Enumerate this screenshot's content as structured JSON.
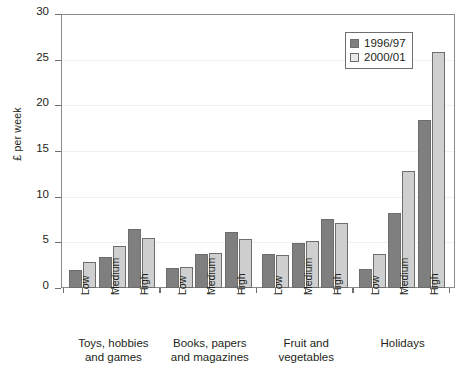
{
  "chart_data": {
    "type": "bar",
    "title": "",
    "xlabel": "",
    "ylabel": "£ per week",
    "ylim": [
      0,
      30
    ],
    "yticks": [
      0,
      5,
      10,
      15,
      20,
      25,
      30
    ],
    "grid": true,
    "legend_position": "top-right",
    "categories": [
      "Low",
      "Medium",
      "High"
    ],
    "groups": [
      {
        "label_line1": "Toys, hobbies",
        "label_line2": "and games",
        "label": "Toys, hobbies and games",
        "categories": [
          "Low",
          "Medium",
          "High"
        ],
        "series": [
          {
            "name": "1996/97",
            "values": [
              2.0,
              3.4,
              6.5
            ]
          },
          {
            "name": "2000/01",
            "values": [
              2.9,
              4.6,
              5.5
            ]
          }
        ]
      },
      {
        "label_line1": "Books, papers",
        "label_line2": "and magazines",
        "label": "Books, papers and magazines",
        "categories": [
          "Low",
          "Medium",
          "High"
        ],
        "series": [
          {
            "name": "1996/97",
            "values": [
              2.2,
              3.7,
              6.1
            ]
          },
          {
            "name": "2000/01",
            "values": [
              2.3,
              3.8,
              5.4
            ]
          }
        ]
      },
      {
        "label_line1": "Fruit and",
        "label_line2": "vegetables",
        "label": "Fruit and vegetables",
        "categories": [
          "Low",
          "Medium",
          "High"
        ],
        "series": [
          {
            "name": "1996/97",
            "values": [
              3.7,
              4.9,
              7.6
            ]
          },
          {
            "name": "2000/01",
            "values": [
              3.6,
              5.2,
              7.1
            ]
          }
        ]
      },
      {
        "label_line1": "Holidays",
        "label_line2": "",
        "label": "Holidays",
        "categories": [
          "Low",
          "Medium",
          "High"
        ],
        "series": [
          {
            "name": "1996/97",
            "values": [
              2.1,
              8.2,
              18.4
            ]
          },
          {
            "name": "2000/01",
            "values": [
              3.7,
              12.8,
              25.8
            ]
          }
        ]
      }
    ],
    "series_names": [
      "1996/97",
      "2000/01"
    ],
    "series_colors": [
      "#7f7f7f",
      "#cfcfcf"
    ]
  },
  "legend": {
    "items": [
      {
        "label": "1996/97"
      },
      {
        "label": "2000/01"
      }
    ]
  },
  "axis": {
    "y_label": "£ per week",
    "y_tick_labels": [
      "30",
      "25",
      "20",
      "15",
      "10",
      "5",
      "0"
    ]
  }
}
